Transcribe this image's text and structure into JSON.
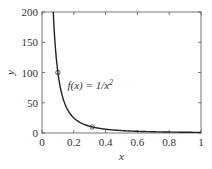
{
  "chart_data": {
    "type": "line",
    "title": "",
    "xlabel": "x",
    "ylabel": "y",
    "xlim": [
      0,
      1
    ],
    "ylim": [
      0,
      200
    ],
    "xticks": [
      0,
      0.2,
      0.4,
      0.6,
      0.8,
      1
    ],
    "xtick_labels": [
      "0",
      "0.2",
      "0.4",
      "0.6",
      "0.8",
      "1"
    ],
    "yticks": [
      0,
      50,
      100,
      150,
      200
    ],
    "ytick_labels": [
      "0",
      "50",
      "100",
      "150",
      "200"
    ],
    "grid": false,
    "legend": null,
    "series": [
      {
        "name": "f(x) = 1/x^2",
        "function": "1/x^2",
        "color": "#222222",
        "x": [
          0.0707,
          0.08,
          0.09,
          0.1,
          0.12,
          0.15,
          0.2,
          0.25,
          0.3,
          0.316,
          0.4,
          0.5,
          0.6,
          0.7,
          0.8,
          0.9,
          1.0
        ],
        "values": [
          200,
          156.25,
          123.46,
          100,
          69.44,
          44.44,
          25,
          16,
          11.11,
          10,
          6.25,
          4,
          2.78,
          2.04,
          1.56,
          1.23,
          1
        ]
      }
    ],
    "markers": [
      {
        "x": 0.1,
        "y": 100,
        "shape": "open-circle"
      },
      {
        "x": 0.316,
        "y": 10,
        "shape": "open-circle"
      }
    ],
    "annotations": [
      {
        "text": "f(x) = 1/x",
        "superscript": "2",
        "x": 0.16,
        "y": 80
      }
    ]
  }
}
